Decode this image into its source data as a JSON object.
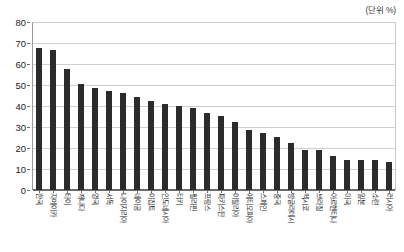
{
  "caption": {
    "unit_label": "(단위 %)"
  },
  "chart_data": {
    "type": "bar",
    "title": "",
    "subtitle": "",
    "xlabel": "",
    "ylabel": "",
    "unit_note": "(단위 %)",
    "ylim": [
      0,
      80
    ],
    "ytick_step": 10,
    "ytick_labels": [
      "0",
      "10",
      "20",
      "30",
      "40",
      "50",
      "60",
      "70",
      "80"
    ],
    "grid": true,
    "grid_axis": "y",
    "legend": false,
    "legend_position": "none",
    "bar_color": "#2b2b2b",
    "categories": [
      "한국",
      "자메이카",
      "타이",
      "캐나다",
      "영국",
      "서독",
      "나이지리아",
      "네이공",
      "이집트",
      "인도네시아",
      "터키",
      "필리핀",
      "프랑스",
      "파키스탄",
      "이탈리아",
      "에티오피아",
      "스페인",
      "중국",
      "방글라데시",
      "멕시코",
      "브라질",
      "아르헨티나",
      "미국",
      "일본",
      "소련",
      "러시아"
    ],
    "values": [
      67.5,
      66.5,
      57.8,
      50.4,
      48.4,
      47.3,
      46.2,
      44.2,
      42.2,
      41.0,
      40.1,
      39.1,
      36.7,
      35.4,
      32.6,
      28.6,
      27.2,
      25.4,
      22.2,
      19.1,
      18.9,
      16.1,
      14.4,
      14.3,
      14.2,
      13.4
    ]
  }
}
